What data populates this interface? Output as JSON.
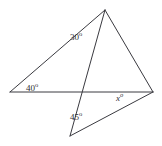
{
  "figure": {
    "type": "geometry-diagram",
    "background_color": "#ffffff",
    "stroke_color": "#3a3a40",
    "stroke_width": 1,
    "canvas": {
      "width": 162,
      "height": 146
    },
    "points": {
      "apex_top": {
        "x": 105,
        "y": 10,
        "name": "top-apex"
      },
      "left_end": {
        "x": 10,
        "y": 92,
        "name": "left-vertex"
      },
      "right_end": {
        "x": 153,
        "y": 92,
        "name": "right-vertex"
      },
      "bottom_vertex": {
        "x": 70,
        "y": 136,
        "name": "bottom-vertex"
      },
      "intersection": {
        "x": 87,
        "y": 92,
        "name": "intersection-point"
      }
    },
    "segments": [
      {
        "name": "apex-to-left",
        "from": "apex_top",
        "to": "left_end"
      },
      {
        "name": "apex-to-right",
        "from": "apex_top",
        "to": "right_end"
      },
      {
        "name": "horizontal-baseline",
        "from": "left_end",
        "to": "right_end"
      },
      {
        "name": "apex-to-bottom",
        "from": "apex_top",
        "to": "bottom_vertex"
      },
      {
        "name": "bottom-to-right",
        "from": "bottom_vertex",
        "to": "right_end"
      }
    ],
    "labels": [
      {
        "id": "label-30",
        "name": "angle-label-30",
        "value": "30",
        "degree": "o",
        "at_vertex": "apex_top"
      },
      {
        "id": "label-40",
        "name": "angle-label-40",
        "value": "40",
        "degree": "o",
        "at_vertex": "left_end"
      },
      {
        "id": "label-45",
        "name": "angle-label-45",
        "value": "45",
        "degree": "o",
        "at_vertex": "bottom_vertex"
      },
      {
        "id": "label-x",
        "name": "angle-label-x",
        "value": "x",
        "degree": "o",
        "at_vertex": "right_end",
        "italic": true
      }
    ]
  }
}
